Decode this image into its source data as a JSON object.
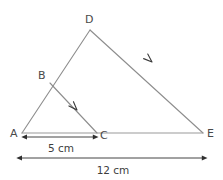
{
  "figure": {
    "type": "geometry-diagram",
    "colors": {
      "edge": "#8d8d8d",
      "baseline": "#9a9a9a",
      "dimension": "#2f2f2f",
      "label_text": "#4a4a4a",
      "background": "#ffffff"
    },
    "vertices": [
      {
        "id": "A",
        "label": "A",
        "x": 22,
        "y": 133,
        "label_x": 10,
        "label_y": 137
      },
      {
        "id": "B",
        "label": "B",
        "x": 50,
        "y": 83,
        "label_x": 38,
        "label_y": 79
      },
      {
        "id": "C",
        "label": "C",
        "x": 97,
        "y": 133,
        "label_x": 100,
        "label_y": 139
      },
      {
        "id": "D",
        "label": "D",
        "x": 90,
        "y": 30,
        "label_x": 85,
        "label_y": 23
      },
      {
        "id": "E",
        "label": "E",
        "x": 203,
        "y": 133,
        "label_x": 207,
        "label_y": 137
      }
    ],
    "segments": [
      {
        "name": "segment-A-D",
        "from": "A",
        "to": "D",
        "x1": 22,
        "y1": 133,
        "x2": 90,
        "y2": 30
      },
      {
        "name": "segment-D-E",
        "from": "D",
        "to": "E",
        "x1": 90,
        "y1": 30,
        "x2": 203,
        "y2": 133
      },
      {
        "name": "segment-A-E",
        "from": "A",
        "to": "E",
        "x1": 22,
        "y1": 133,
        "x2": 203,
        "y2": 133
      },
      {
        "name": "segment-B-C",
        "from": "B",
        "to": "C",
        "x1": 50,
        "y1": 83,
        "x2": 97,
        "y2": 133
      }
    ],
    "direction_arrows": [
      {
        "name": "arrow-mark-bc",
        "on": "segment-B-C",
        "x": 77,
        "y": 110,
        "angle": -133
      },
      {
        "name": "arrow-mark-de",
        "on": "segment-D-E",
        "x": 152,
        "y": 62,
        "angle": -138
      }
    ],
    "dimensions": [
      {
        "name": "dimension-ac",
        "label": "5 cm",
        "from": "A",
        "to": "C",
        "x1": 27,
        "x2": 93,
        "y": 137,
        "label_x": 61,
        "label_y": 152
      },
      {
        "name": "dimension-ae",
        "label": "12 cm",
        "from": "A",
        "to": "E",
        "x1": 22,
        "x2": 202,
        "y": 158,
        "label_x": 113,
        "label_y": 174
      }
    ]
  }
}
